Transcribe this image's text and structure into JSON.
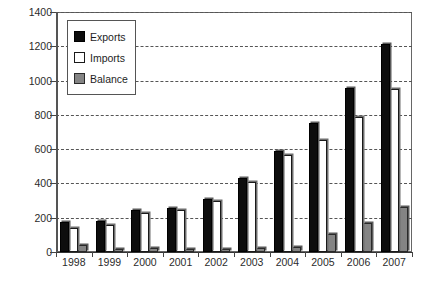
{
  "chart_data": {
    "type": "bar",
    "title": "",
    "subtitle": "",
    "xlabel": "",
    "ylabel": "",
    "categories": [
      "1998",
      "1999",
      "2000",
      "2001",
      "2002",
      "2003",
      "2004",
      "2005",
      "2006",
      "2007"
    ],
    "series": [
      {
        "name": "Exports",
        "color": "#0d0d0d",
        "values": [
          175,
          180,
          245,
          255,
          310,
          430,
          590,
          755,
          955,
          1215
        ]
      },
      {
        "name": "Imports",
        "color": "#ffffff",
        "values": [
          138,
          160,
          225,
          245,
          295,
          410,
          565,
          655,
          785,
          950
        ]
      },
      {
        "name": "Balance",
        "color": "#848484",
        "values": [
          40,
          20,
          25,
          20,
          20,
          25,
          30,
          105,
          170,
          265
        ]
      }
    ],
    "ylim": [
      0,
      1400
    ],
    "y_ticks": [
      0,
      200,
      400,
      600,
      800,
      1000,
      1200,
      1400
    ],
    "y_tick_labels": [
      "0",
      "200",
      "400",
      "600",
      "800",
      "1000",
      "1200",
      "1400"
    ],
    "grid": true,
    "grid_axis": "y",
    "grid_style": "dashed",
    "legend": true,
    "legend_position": "upper-left",
    "legend_entries": [
      "Exports",
      "Imports",
      "Balance"
    ],
    "annotations": []
  }
}
